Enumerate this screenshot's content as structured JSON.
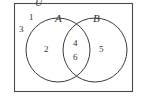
{
  "figure": {
    "type": "venn-diagram",
    "universe_label": "U",
    "background_color": "#ffffff",
    "stroke_color": "#3a3a3a",
    "text_color": "#333333"
  },
  "sets": {
    "left": {
      "label": "A",
      "cx": 58,
      "cy": 50,
      "r": 32
    },
    "right": {
      "label": "B",
      "cx": 95,
      "cy": 50,
      "r": 32
    }
  },
  "rectangle": {
    "x": 14,
    "y": 3,
    "width": 119,
    "height": 89
  },
  "regions": {
    "outside": {
      "name": "outside-both",
      "values": [
        "1",
        "3"
      ]
    },
    "left_only": {
      "name": "a-only",
      "values": [
        "2"
      ]
    },
    "intersection": {
      "name": "a-and-b",
      "values": [
        "4",
        "6"
      ]
    },
    "right_only": {
      "name": "b-only",
      "values": [
        "5"
      ]
    }
  },
  "elements": {
    "universe": "U",
    "label_a": "A",
    "label_b": "B",
    "num_1": "1",
    "num_3": "3",
    "num_2": "2",
    "num_4": "4",
    "num_6": "6",
    "num_5": "5"
  }
}
